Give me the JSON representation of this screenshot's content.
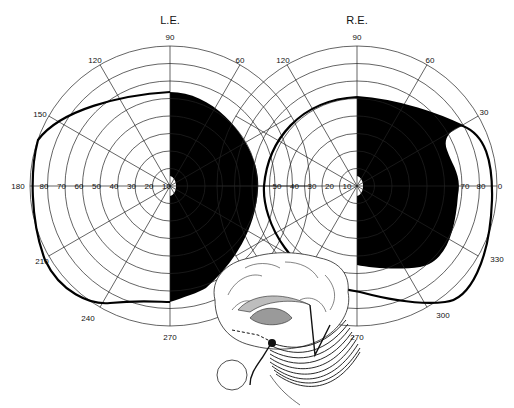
{
  "figure": {
    "type": "visual-field-perimetry-diagram",
    "left_eye": {
      "label": "L.E.",
      "center": [
        170,
        186
      ],
      "angle_labels": [
        "90",
        "60",
        "120",
        "150",
        "180",
        "210",
        "240",
        "270"
      ],
      "ring_labels": [
        "10",
        "20",
        "30",
        "40",
        "50",
        "60",
        "70",
        "80"
      ],
      "defect": "temporal (right) half blacked out, macular sparing"
    },
    "right_eye": {
      "label": "R.E.",
      "center": [
        357,
        186
      ],
      "angle_labels": [
        "90",
        "60",
        "30",
        "120",
        "0",
        "330",
        "300",
        "270"
      ],
      "ring_labels": [
        "10",
        "20",
        "30",
        "40",
        "50",
        "70",
        "80"
      ],
      "defect": "nasal (right) half blacked out with peripheral sparing near 30-0, macular sparing"
    },
    "inset": "midsagittal brain drawing with optic radiation lesion",
    "colors": {
      "ink": "#111111",
      "background": "#ffffff",
      "shade": "#bdbdbd"
    }
  }
}
